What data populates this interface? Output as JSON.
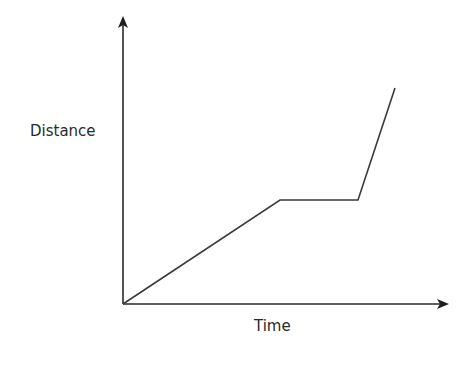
{
  "chart_data": {
    "type": "line",
    "title": "",
    "xlabel": "Time",
    "ylabel": "Distance",
    "grid": false,
    "legend": null,
    "ticks": false,
    "points_description": "Distance-time graph: constant speed, then stationary, then faster constant speed",
    "series": [
      {
        "name": "distance",
        "x": [
          0,
          5,
          7.5,
          8.7
        ],
        "y": [
          0,
          3.6,
          3.6,
          7.5
        ]
      }
    ],
    "pixel_points": [
      [
        123,
        304
      ],
      [
        280,
        200
      ],
      [
        358,
        200
      ],
      [
        395,
        88
      ]
    ],
    "axes": {
      "origin": [
        123,
        304
      ],
      "y_arrow_tip": [
        123,
        16
      ],
      "x_arrow_tip": [
        449,
        304
      ]
    },
    "colors": {
      "line": "#3a3a3a",
      "axes": "#2a2a2a"
    }
  },
  "labels": {
    "y": "Distance",
    "x": "Time"
  }
}
